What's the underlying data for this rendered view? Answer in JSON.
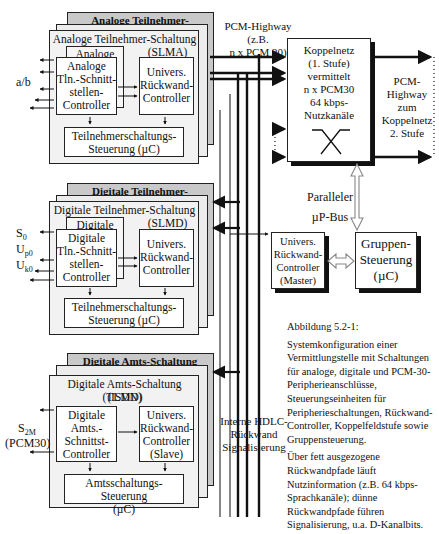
{
  "analog_card": {
    "back_title": "Analoge Teilnehmer-Schaltung",
    "title": "Analoge Teilnehmer-Schaltung",
    "code": "(SLMA)",
    "interface_back_label": "Analoge",
    "interface_label": "Analoge\nTln.-Schnitt-\nstellen-\nController",
    "backplane_label": "Univers.\nRückwand-\nController",
    "control_label": "Teilnehmerschaltungs-\nSteuerung (µC)",
    "port_label": "a/b"
  },
  "digital_card": {
    "back_title": "Digitale Teilnehmer-Schaltung",
    "title": "Digitale Teilnehmer-Schaltung",
    "code": "(SLMD)",
    "interface_back_label": "Digitale",
    "interface_label": "Digitale\nTln.-Schnitt-\nstellen-\nController",
    "backplane_label": "Univers.\nRückwand-\nController",
    "control_label": "Teilnehmerschaltungs-\nSteuerung (µC)",
    "port_labels": [
      "S0",
      "Up0",
      "Uk0"
    ]
  },
  "trunk_card": {
    "back_title": "Digitale Amts-Schaltung",
    "title": "Digitale Amts-Schaltung (ISDN)",
    "code": "(TLMD)",
    "interface_label": "Digitale\nAmts.-\nSchnittst-\nController",
    "backplane_label": "Univers.\nRückwand-\nController\n(Slave)",
    "control_label": "Amtsschaltungs-Steuerung\n(µC)",
    "port_label_main": "S",
    "port_label_sub": "2M",
    "port_label_2": "(PCM30)"
  },
  "pcm_highway_label": "PCM-Highway\n(z.B.\nn x PCM 30)",
  "switch": {
    "label": "Koppelnetz\n(1. Stufe)\nvermittelt\nn x PCM30\n64 kbps-\nNutzkanäle"
  },
  "pcm_highway_stage2_label": "PCM-\nHighway\nzum\nKoppelnetz\n2. Stufe",
  "parallel_bus_label": "Paralleler\nµP-Bus",
  "master_controller_label": "Univers.\nRückwand-\nController\n(Master)",
  "group_control_label": "Gruppen-\nSteuerung\n(µC)",
  "hdlc_label": "Interne HDLC-\nRückwand\nSignalisierung",
  "caption": {
    "figure": "Abbildung 5.2-1:",
    "paragraph1": "Systemkonfiguration einer Vermittlungstelle mit Schaltungen für analoge, digitale und PCM-30-Peripherieanschlüsse, Steuerungseinheiten für Peripherieschaltungen, Rückwand-Controller, Koppelfeldstufe sowie Gruppensteuerung.",
    "paragraph2": "Über fett ausgezogene Rückwandpfade läuft Nutzinformation (z.B. 64 kbps-Sprachkanäle); dünne Rückwandpfade führen Signalisierung, u.a. D-Kanalbits."
  }
}
